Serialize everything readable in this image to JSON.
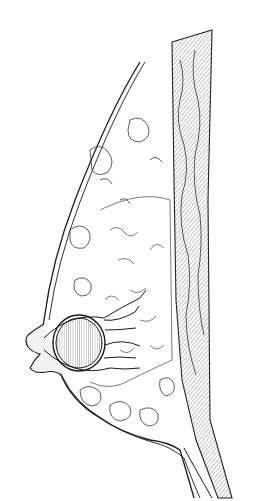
{
  "figure": {
    "type": "anatomical-line-illustration",
    "view": "sagittal",
    "labels": [],
    "colors": {
      "ink": "#1a1a1a",
      "background": "#ffffff",
      "hatch": "#555555"
    }
  }
}
